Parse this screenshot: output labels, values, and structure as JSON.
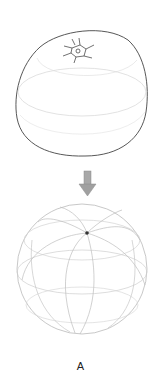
{
  "figure": {
    "panel_label": "A",
    "elements": [
      {
        "name": "orange-sketch",
        "description": "pencil sketch of an orange with stem at top"
      },
      {
        "name": "down-arrow",
        "description": "gray downward arrow"
      },
      {
        "name": "wireframe-sphere",
        "description": "sphere with meridian and latitude guide lines converging at a pole dot"
      }
    ],
    "colors": {
      "outline": "#444444",
      "guide": "#c8c8c8",
      "arrow": "#9a9a9a",
      "pole": "#333333"
    }
  }
}
